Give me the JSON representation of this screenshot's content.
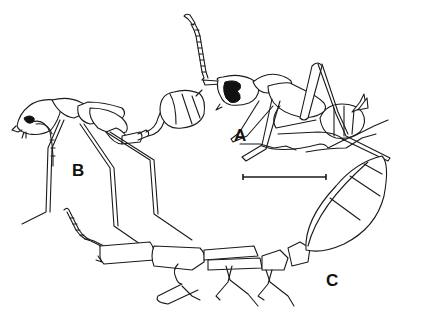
{
  "figure": {
    "type": "scientific-line-drawing",
    "panels": [
      {
        "label": "A",
        "description": "worker ant, lateral view, head with dark eye patch, antenna raised"
      },
      {
        "label": "B",
        "description": "ant with long legs, elongate petiole and gaster"
      },
      {
        "label": "C",
        "description": "elongate body with segmented gaster, lateral view"
      }
    ],
    "scale_bar": {
      "present": true,
      "label": ""
    },
    "colors": {
      "ink": "#1a1a1a",
      "background": "#ffffff"
    }
  }
}
